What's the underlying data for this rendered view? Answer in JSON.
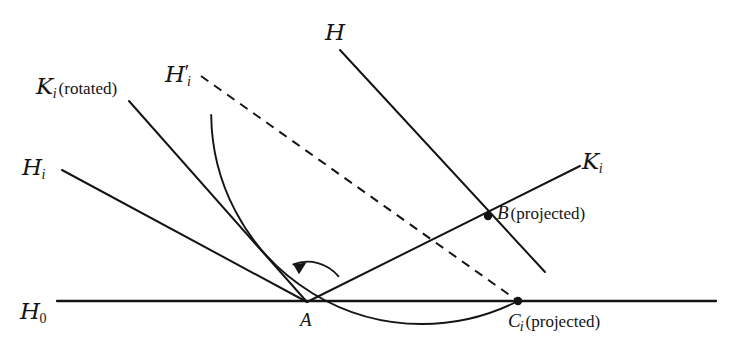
{
  "figure": {
    "type": "geometry-diagram",
    "background": "#ffffff",
    "ink_color": "#141414",
    "width": 740,
    "height": 355
  },
  "labels": {
    "k_rotated": {
      "base": "K",
      "sub": "i",
      "paren": "(rotated)"
    },
    "h_prime_i": {
      "base": "H",
      "prime": "′",
      "sub": "i"
    },
    "h": {
      "base": "H"
    },
    "h_i": {
      "base": "H",
      "sub": "i"
    },
    "k_i": {
      "base": "K",
      "sub": "i"
    },
    "h_0": {
      "base": "H",
      "sub": "0"
    },
    "point_a": {
      "text": "A"
    },
    "point_b": {
      "text": "B",
      "paren": "(projected)"
    },
    "point_c_i": {
      "base": "C",
      "sub": "i",
      "paren": "(projected)"
    }
  },
  "geometry": {
    "vertex_a": {
      "x": 307,
      "y": 302
    },
    "point_b": {
      "x": 488,
      "y": 216
    },
    "point_c": {
      "x": 518,
      "y": 301
    },
    "baseline": {
      "x1": 57,
      "y1": 301,
      "x2": 716,
      "y2": 301
    },
    "rays": [
      {
        "name": "h-i-ray",
        "x1": 62,
        "y1": 170,
        "x2": 307,
        "y2": 302,
        "style": "solid"
      },
      {
        "name": "k-i-rotated-ray",
        "x1": 129,
        "y1": 101,
        "x2": 307,
        "y2": 302,
        "style": "solid"
      },
      {
        "name": "h-ray",
        "x1": 340,
        "y1": 50,
        "x2": 545,
        "y2": 272,
        "style": "solid"
      },
      {
        "name": "k-i-ray",
        "x1": 307,
        "y1": 302,
        "x2": 580,
        "y2": 166,
        "style": "solid"
      },
      {
        "name": "h-prime-i-dashed",
        "x1": 201,
        "y1": 76,
        "x2": 518,
        "y2": 301,
        "style": "dashed"
      }
    ],
    "arc": {
      "name": "rotation-arc",
      "center_x": 307,
      "center_y": 302,
      "radius": 211,
      "start_deg": 0,
      "end_deg": 117
    },
    "rotation_arrow": {
      "name": "rotation-direction-arrow",
      "center_x": 307,
      "center_y": 302,
      "radius": 40,
      "start_deg": 38,
      "end_deg": 110
    }
  }
}
